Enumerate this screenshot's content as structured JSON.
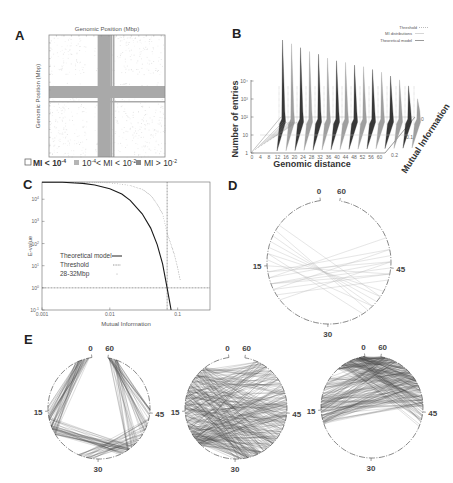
{
  "figure": {
    "panels": [
      "A",
      "B",
      "C",
      "D",
      "E"
    ]
  },
  "chart_data": [
    {
      "panel": "A",
      "type": "heatmap",
      "xlabel": "Genomic Position (Mbp)",
      "ylabel": "Genomic Position (Mbp)",
      "x_range_mbp": [
        0,
        62
      ],
      "y_range_mbp": [
        0,
        62
      ],
      "high_mi_band_mbp": [
        [
          26,
          33
        ],
        [
          34,
          35
        ]
      ],
      "legend": [
        {
          "label": "MI < 10",
          "exp": "-4",
          "shade": "#ffffff",
          "edge": "#555555"
        },
        {
          "label": "10",
          "exp": "-4",
          "label2": "< MI < 10",
          "exp2": "-2",
          "shade": "#b5b5b5"
        },
        {
          "label": "MI > 10",
          "exp": "-2",
          "shade": "#8a8a8a"
        }
      ],
      "colors": {
        "band": "#a9a9a9",
        "speckle": "#c8c8c8",
        "frame": "#888888"
      }
    },
    {
      "panel": "B",
      "type": "area",
      "xlabel": "Genomic distance",
      "ylabel": "Number of entries",
      "zlabel": "Mutual Information",
      "x_ticks": [
        "0",
        "4",
        "8",
        "12",
        "16",
        "20",
        "24",
        "28",
        "32",
        "36",
        "40",
        "44",
        "48",
        "52",
        "56",
        "60"
      ],
      "y_ticks": [
        "1",
        "10",
        "10²",
        "10³",
        "10⁴"
      ],
      "y_scale": "log",
      "z_ticks": [
        "0",
        "0.1",
        "0.2"
      ],
      "legend": [
        "Threshold",
        "MI distributions",
        "Theoretical model"
      ],
      "legend_position": "top-right",
      "series": [
        {
          "name": "peak heights (log10 entries)",
          "x": [
            2,
            6,
            10,
            14,
            18,
            22,
            26,
            30,
            34,
            38,
            42,
            46,
            50,
            54,
            58,
            62
          ],
          "values": [
            4.95,
            4.85,
            4.75,
            4.65,
            4.6,
            4.5,
            4.45,
            4.45,
            4.4,
            4.4,
            4.35,
            4.3,
            4.2,
            4.1,
            3.9,
            3.4
          ]
        }
      ]
    },
    {
      "panel": "C",
      "type": "line",
      "xlabel": "Mutual Information",
      "ylabel": "E-value",
      "x_scale": "log",
      "y_scale": "log",
      "xlim": [
        0.001,
        0.3
      ],
      "ylim": [
        0.1,
        60000
      ],
      "x_ticks": [
        "0.001",
        "0.01",
        "0.1"
      ],
      "y_ticks": [
        {
          "base": "10",
          "exp": "-1"
        },
        {
          "base": "10",
          "exp": "0"
        },
        {
          "base": "10",
          "exp": "1"
        },
        {
          "base": "10",
          "exp": "2"
        },
        {
          "base": "10",
          "exp": "3"
        },
        {
          "base": "10",
          "exp": "4"
        }
      ],
      "threshold": {
        "x": 0.07,
        "y": 1
      },
      "legend": [
        "Theoretical model",
        "Threshold",
        "28-32Mbp"
      ],
      "legend_position": "center-left",
      "series": [
        {
          "name": "Theoretical model",
          "x": [
            0.001,
            0.002,
            0.004,
            0.006,
            0.01,
            0.015,
            0.02,
            0.03,
            0.04,
            0.05,
            0.06,
            0.07,
            0.075,
            0.08
          ],
          "values": [
            60000,
            58000,
            52000,
            44000,
            30000,
            17000,
            9000,
            2200,
            500,
            90,
            12,
            1,
            0.3,
            0.1
          ]
        },
        {
          "name": "28-32Mbp",
          "x": [
            0.003,
            0.006,
            0.01,
            0.02,
            0.03,
            0.04,
            0.05,
            0.06,
            0.07,
            0.08,
            0.09,
            0.1,
            0.11
          ],
          "values": [
            60000,
            58000,
            55000,
            42000,
            28000,
            15000,
            6000,
            2200,
            300,
            90,
            30,
            8,
            2
          ]
        }
      ]
    },
    {
      "panel": "D",
      "type": "circos",
      "tick_labels": [
        "0",
        "15",
        "30",
        "45",
        "60"
      ],
      "chords": [
        [
          16,
          48
        ],
        [
          17,
          47
        ],
        [
          18,
          46
        ],
        [
          18,
          45
        ],
        [
          19,
          44
        ],
        [
          20,
          43
        ],
        [
          17,
          50
        ],
        [
          10,
          38
        ],
        [
          11,
          39
        ],
        [
          12,
          40
        ],
        [
          13,
          41
        ],
        [
          9,
          37
        ],
        [
          14,
          38
        ],
        [
          21,
          46
        ],
        [
          8,
          40
        ],
        [
          15,
          44
        ],
        [
          16,
          46
        ],
        [
          19,
          48
        ],
        [
          13,
          36
        ],
        [
          18,
          44
        ]
      ],
      "line_color": "#b8b8b8"
    },
    {
      "panel": "E",
      "type": "circos",
      "subplots": [
        {
          "name": "E1",
          "tick_labels": [
            "0",
            "15",
            "30",
            "45",
            "60"
          ],
          "pattern": "short-range-arcs"
        },
        {
          "name": "E2",
          "tick_labels": [
            "0",
            "15",
            "30",
            "45",
            "60"
          ],
          "pattern": "dense-crossing"
        },
        {
          "name": "E3",
          "tick_labels": [
            "0",
            "15",
            "30",
            "45",
            "60"
          ],
          "pattern": "top-concentrated"
        }
      ],
      "line_color": "#444444"
    }
  ]
}
